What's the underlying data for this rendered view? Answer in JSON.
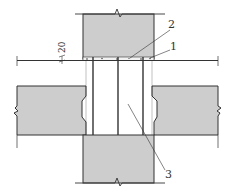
{
  "diagram": {
    "type": "structural-section",
    "colors": {
      "concrete_fill": "#cdcdcd",
      "line": "#333333",
      "background": "#ffffff"
    },
    "dimension": {
      "value": "20"
    },
    "labels": [
      {
        "id": "1",
        "text": "1"
      },
      {
        "id": "2",
        "text": "2"
      },
      {
        "id": "3",
        "text": "3"
      }
    ],
    "components": {
      "upper_column": "upper column",
      "lower_column": "lower column",
      "left_slab": "left hollow-core slab",
      "right_slab": "right hollow-core slab",
      "rods": [
        "rod-left",
        "rod-center",
        "rod-right"
      ],
      "mortar_joint": "mortar bed"
    }
  }
}
